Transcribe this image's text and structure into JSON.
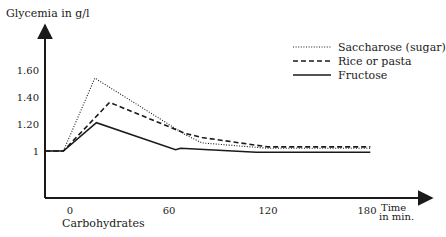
{
  "chart_data": {
    "type": "line",
    "title": "",
    "ylabel": "Glycemia in g/l",
    "xlabel": "Time in min.",
    "xlabel_lines": [
      "Time",
      "in min."
    ],
    "x_annotation": "Carbohydrates",
    "xticks": [
      0,
      60,
      120,
      180
    ],
    "yticks": [
      1,
      1.2,
      1.4,
      1.6
    ],
    "ytick_labels": [
      "1",
      "1.20",
      "1.40",
      "1.60"
    ],
    "xlim": [
      -15,
      220
    ],
    "ylim": [
      0.65,
      1.95
    ],
    "grid": false,
    "legend_position": "top-right",
    "series": [
      {
        "name": "Saccharose (sugar)",
        "style": "dotted",
        "points": [
          [
            -15,
            1.0
          ],
          [
            -4,
            1.0
          ],
          [
            15,
            1.54
          ],
          [
            70,
            1.12
          ],
          [
            80,
            1.06
          ],
          [
            120,
            1.02
          ],
          [
            182,
            1.02
          ]
        ]
      },
      {
        "name": "Rice or pasta",
        "style": "dashed",
        "points": [
          [
            -15,
            1.0
          ],
          [
            -4,
            1.0
          ],
          [
            24,
            1.36
          ],
          [
            70,
            1.13
          ],
          [
            80,
            1.1
          ],
          [
            120,
            1.03
          ],
          [
            182,
            1.03
          ]
        ]
      },
      {
        "name": "Fructose",
        "style": "solid",
        "points": [
          [
            -15,
            1.0
          ],
          [
            -4,
            1.0
          ],
          [
            16,
            1.21
          ],
          [
            64,
            1.01
          ],
          [
            67,
            1.02
          ],
          [
            113,
            0.99
          ],
          [
            182,
            0.99
          ]
        ]
      }
    ]
  },
  "layout": {
    "x0_px": 70,
    "px_per_min": 1.65,
    "y1_px": 151,
    "px_per_unit": 135,
    "axis_x_px": 45,
    "axis_y_px": 198,
    "yaxis_top_px": 25,
    "xaxis_right_px": 432
  }
}
